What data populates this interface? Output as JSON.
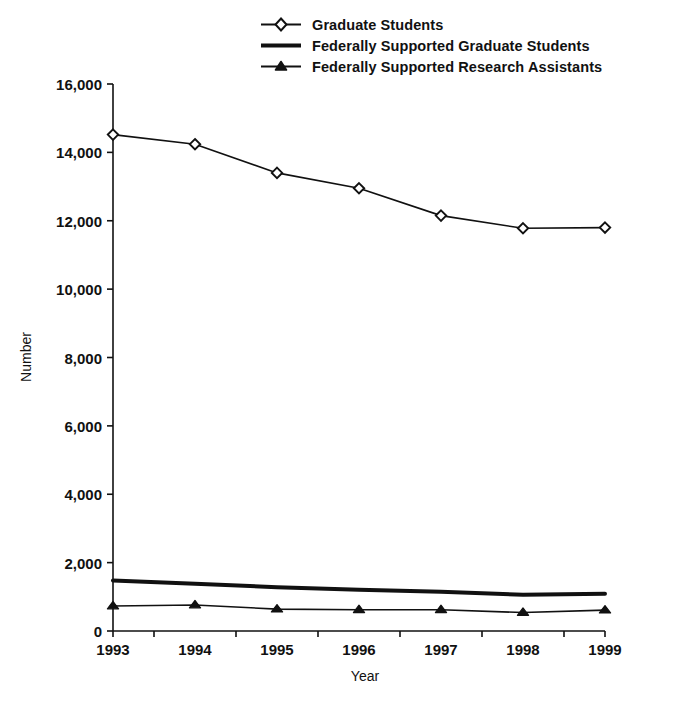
{
  "chart_data": {
    "type": "line",
    "title": "",
    "xlabel": "Year",
    "ylabel": "Number",
    "x": [
      1993,
      1994,
      1995,
      1996,
      1997,
      1998,
      1999
    ],
    "categories": [
      "1993",
      "1994",
      "1995",
      "1996",
      "1997",
      "1998",
      "1999"
    ],
    "xtick_labels": [
      "1993",
      "1994",
      "1995",
      "1996",
      "1997",
      "1998",
      "1999"
    ],
    "ytick_labels": [
      "0",
      "2,000",
      "4,000",
      "6,000",
      "8,000",
      "10,000",
      "12,000",
      "14,000",
      "16,000"
    ],
    "ytick_values": [
      0,
      2000,
      4000,
      6000,
      8000,
      10000,
      12000,
      14000,
      16000
    ],
    "ylim": [
      0,
      16000
    ],
    "xlim": [
      1993,
      1999
    ],
    "grid": false,
    "legend_position": "top-center",
    "series": [
      {
        "name": "Graduate Students",
        "marker": "open-diamond",
        "line_width": 1.6,
        "color": "#111111",
        "values": [
          14520,
          14240,
          13400,
          12950,
          12150,
          11780,
          11800
        ]
      },
      {
        "name": "Federally Supported Graduate Students",
        "marker": "none",
        "line_width": 4.0,
        "color": "#111111",
        "values": [
          1480,
          1380,
          1280,
          1210,
          1150,
          1060,
          1090
        ]
      },
      {
        "name": "Federally Supported Research Assistants",
        "marker": "filled-triangle",
        "line_width": 1.6,
        "color": "#111111",
        "values": [
          730,
          760,
          640,
          620,
          620,
          540,
          610
        ]
      }
    ]
  },
  "legend": {
    "items": [
      {
        "label": "Graduate Students",
        "swatch": "line-with-open-diamond-icon"
      },
      {
        "label": "Federally Supported Graduate Students",
        "swatch": "thick-line-icon"
      },
      {
        "label": "Federally Supported Research Assistants",
        "swatch": "line-with-filled-triangle-icon"
      }
    ]
  },
  "axes": {
    "x_title": "Year",
    "y_title": "Number"
  }
}
